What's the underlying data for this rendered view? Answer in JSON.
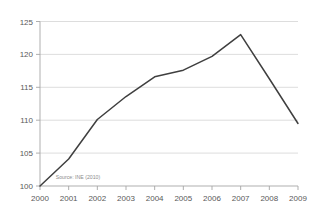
{
  "chart_data": {
    "type": "line",
    "title": "",
    "subtitle": "",
    "xlabel": "",
    "ylabel": "",
    "categories": [
      "2000",
      "2001",
      "2002",
      "2003",
      "2004",
      "2005",
      "2006",
      "2007",
      "2008",
      "2009"
    ],
    "x": [
      2000,
      2001,
      2002,
      2003,
      2004,
      2005,
      2006,
      2007,
      2008,
      2009
    ],
    "series": [
      {
        "name": "Index",
        "values": [
          100.0,
          104.1,
          110.1,
          113.6,
          116.6,
          117.6,
          119.7,
          123.0,
          116.3,
          109.5
        ],
        "color": "#3f3f3f"
      }
    ],
    "ylim": [
      100,
      125
    ],
    "yticks": [
      100,
      105,
      110,
      115,
      120,
      125
    ],
    "ytick_labels": [
      "100",
      "105",
      "110",
      "115",
      "120",
      "125"
    ],
    "xtick_labels": [
      "2000",
      "2001",
      "2002",
      "2003",
      "2004",
      "2005",
      "2006",
      "2007",
      "2008",
      "2009"
    ],
    "grid": "horizontal",
    "legend": "none",
    "annotations": [
      {
        "name": "source-note",
        "text": "Source: INE (2010)",
        "x": 2000.55,
        "y": 101.1
      }
    ]
  },
  "colors": {
    "background": "#ffffff",
    "series_line": "#3f3f3f",
    "gridline": "#d4d4d4",
    "axis": "#a6a6a6",
    "tick_text": "#595959",
    "annotation_text": "#8c8c8c"
  }
}
